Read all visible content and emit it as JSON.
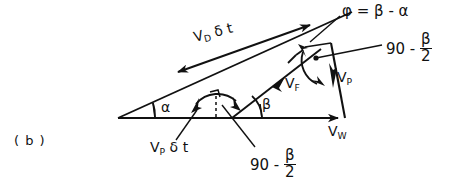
{
  "figure": {
    "panel_label": "( b )",
    "type": "velocity-vector-diagram",
    "caption_position": "bottom-left"
  },
  "labels": {
    "phi_equation": {
      "text": "φ = β - α",
      "phi": "φ",
      "equals": "=",
      "beta": "β",
      "minus": "-",
      "alpha": "α"
    },
    "vd_dt": {
      "symbol": "V",
      "subscript": "D",
      "delta_t": "δ t"
    },
    "vp_dt": {
      "symbol": "V",
      "subscript": "P",
      "delta_t": "δ t"
    },
    "vf": {
      "symbol": "V",
      "subscript": "F"
    },
    "vp": {
      "symbol": "V",
      "subscript": "P"
    },
    "vw": {
      "symbol": "V",
      "subscript": "W"
    },
    "angle_alpha": "α",
    "angle_beta": "β",
    "ninety_minus_half_beta_top": {
      "lead": "90 -",
      "numerator": "β",
      "denominator": "2"
    },
    "ninety_minus_half_beta_bottom": {
      "lead": "90 -",
      "numerator": "β",
      "denominator": "2"
    }
  },
  "geometry": {
    "baseline": {
      "x1": 118,
      "y1": 118,
      "x2": 345,
      "y2": 118
    },
    "upper_ray": {
      "x1": 118,
      "y1": 118,
      "x2": 352,
      "y2": 12
    },
    "right_edge": {
      "x1": 331,
      "y1": 43,
      "x2": 345,
      "y2": 118
    },
    "vf_ray": {
      "x1": 232,
      "y1": 118,
      "x2": 318,
      "y2": 52
    },
    "vd_arrow": {
      "x1": 176,
      "y1": 73,
      "x2": 312,
      "y2": 24,
      "double_headed": true
    },
    "apex_dot": {
      "x": 316,
      "y": 58
    }
  },
  "colors": {
    "ink": "#111111",
    "background": "#ffffff"
  }
}
